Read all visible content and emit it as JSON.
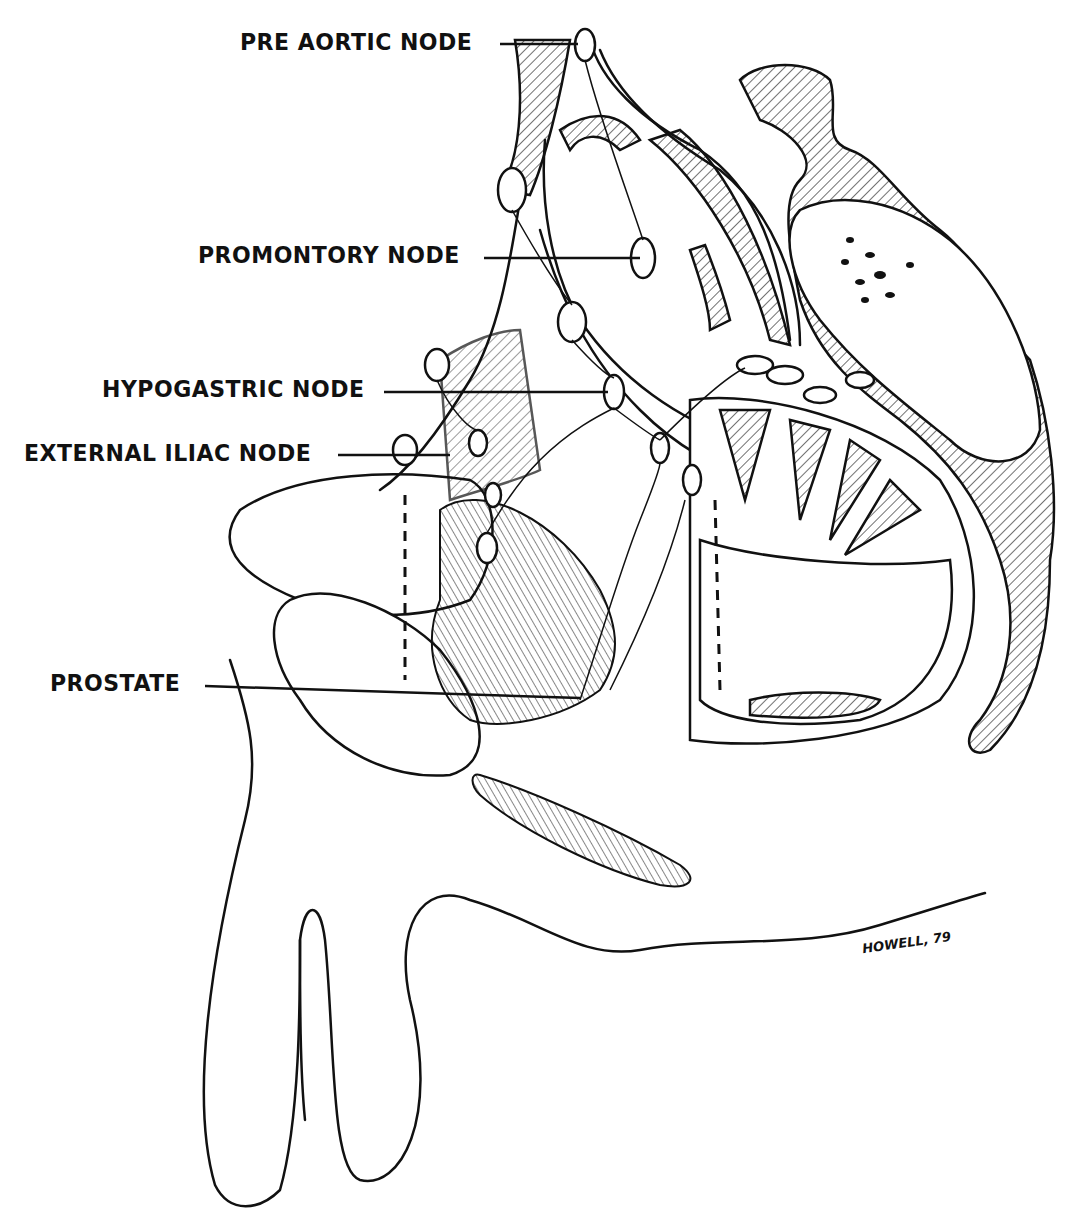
{
  "figure": {
    "type": "anatomical line drawing",
    "signature": "HOWELL, 79",
    "colors": {
      "ink": "#111111",
      "background": "#ffffff"
    }
  },
  "labels": [
    {
      "id": "pre-aortic-node",
      "text": "PRE AORTIC NODE",
      "x": 240,
      "y": 30,
      "leader": {
        "x1": 500,
        "y1": 44,
        "x2": 578,
        "y2": 44
      }
    },
    {
      "id": "promontory-node",
      "text": "PROMONTORY NODE",
      "x": 198,
      "y": 243,
      "leader": {
        "x1": 484,
        "y1": 258,
        "x2": 640,
        "y2": 258
      }
    },
    {
      "id": "hypogastric-node",
      "text": "HYPOGASTRIC NODE",
      "x": 102,
      "y": 377,
      "leader": {
        "x1": 384,
        "y1": 392,
        "x2": 608,
        "y2": 392
      }
    },
    {
      "id": "external-iliac-node",
      "text": "EXTERNAL ILIAC NODE",
      "x": 24,
      "y": 441,
      "leader": {
        "x1": 338,
        "y1": 455,
        "x2": 450,
        "y2": 455
      }
    },
    {
      "id": "prostate",
      "text": "PROSTATE",
      "x": 50,
      "y": 671,
      "leader": {
        "x1": 205,
        "y1": 686,
        "x2": 580,
        "y2": 698
      }
    }
  ]
}
